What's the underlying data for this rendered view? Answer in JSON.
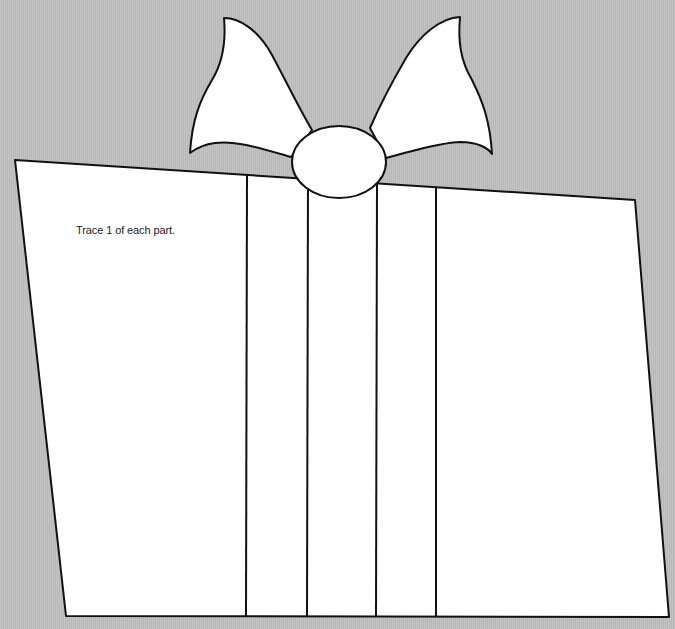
{
  "template": {
    "title": "Gift box craft template",
    "instruction": "Trace 1 of each part.",
    "colors": {
      "background": "#bdbdbd",
      "fill": "#ffffff",
      "stroke": "#111111"
    },
    "parts": [
      "box",
      "ribbon-strips",
      "bow-left-loop",
      "bow-right-loop",
      "bow-knot"
    ]
  }
}
